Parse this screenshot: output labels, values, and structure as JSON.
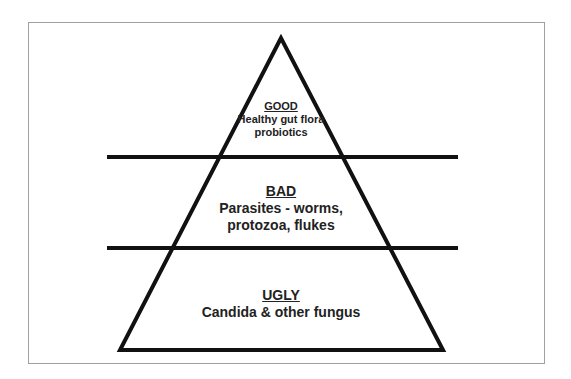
{
  "diagram": {
    "type": "pyramid",
    "colors": {
      "stroke": "#111111",
      "background": "#ffffff",
      "frame": "#a0a0a0",
      "text": "#222222"
    },
    "tiers": [
      {
        "title": "GOOD",
        "lines": [
          "Healthy gut flora",
          "probiotics"
        ]
      },
      {
        "title": "BAD",
        "lines": [
          "Parasites - worms,",
          "protozoa, flukes"
        ]
      },
      {
        "title": "UGLY",
        "lines": [
          "Candida & other fungus"
        ]
      }
    ]
  }
}
